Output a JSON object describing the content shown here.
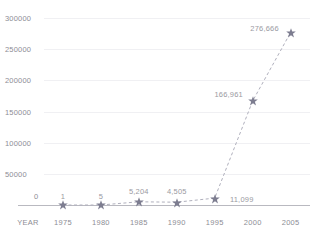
{
  "chart_data": {
    "type": "line",
    "title": "",
    "subtitle": "",
    "xlabel": "YEAR",
    "ylabel": "",
    "categories": [
      "1975",
      "1980",
      "1985",
      "1990",
      "1995",
      "2000",
      "2005"
    ],
    "x": [
      1975,
      1980,
      1985,
      1990,
      1995,
      2000,
      2005
    ],
    "values": [
      1,
      5,
      5204,
      4505,
      11099,
      166961,
      276666
    ],
    "point_labels": [
      "1",
      "5",
      "5,204",
      "4,505",
      "11,099",
      "166,961",
      "276,666"
    ],
    "origin_label": "0",
    "ytick_labels": [
      "0",
      "50000",
      "100000",
      "150000",
      "200000",
      "250000",
      "300000"
    ],
    "yticks": [
      0,
      50000,
      100000,
      150000,
      200000,
      250000,
      300000
    ],
    "ylim": [
      0,
      300000
    ],
    "xlim": [
      1972.5,
      2006.5
    ],
    "grid": true,
    "legend": false,
    "legend_position": "none",
    "marker": "star",
    "line_style": "dashed",
    "colors": {
      "marker": "#7d7d90",
      "line": "#b0b0bd",
      "label_text": "#9a9aa2",
      "tick_text": "#8d8d95",
      "gridline": "#f0f0f3",
      "axis": "#b9b9c0",
      "background": "#ffffff"
    }
  },
  "axis": {
    "x_axis_name": "YEAR"
  }
}
